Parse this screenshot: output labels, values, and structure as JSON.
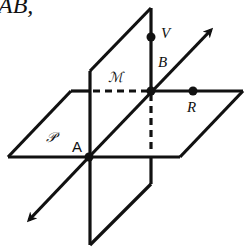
{
  "header": {
    "text": "AB,"
  },
  "diagram": {
    "planes": [
      {
        "id": "P",
        "label": "𝒫",
        "description": "horizontal plane"
      },
      {
        "id": "M",
        "label": "ℳ",
        "description": "vertical plane"
      }
    ],
    "points": [
      {
        "id": "A",
        "label": "A"
      },
      {
        "id": "B",
        "label": "B"
      },
      {
        "id": "V",
        "label": "V"
      },
      {
        "id": "R",
        "label": "R"
      }
    ],
    "line": {
      "id": "AB",
      "description": "line through A and B with arrows at both ends"
    },
    "stroke_color": "#111111",
    "background": "#ffffff"
  }
}
